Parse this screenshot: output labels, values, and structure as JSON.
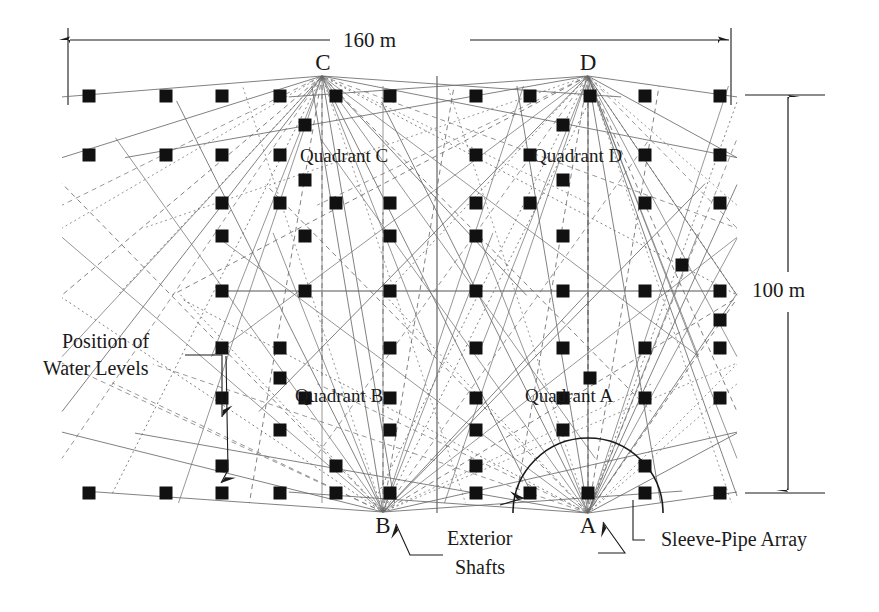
{
  "figure": {
    "type": "engineering-plan-diagram"
  },
  "dimensions": {
    "width_label": "160 m",
    "height_label": "100 m",
    "site_width_m": 160,
    "site_height_m": 100
  },
  "shafts": [
    {
      "id": "A",
      "label": "A",
      "x": 588,
      "y": 513,
      "has_arc": true
    },
    {
      "id": "B",
      "label": "B",
      "x": 383,
      "y": 512,
      "has_arc": false
    },
    {
      "id": "C",
      "label": "C",
      "x": 322,
      "y": 76,
      "has_arc": false
    },
    {
      "id": "D",
      "label": "D",
      "x": 588,
      "y": 76,
      "has_arc": false
    }
  ],
  "quadrants": [
    {
      "id": "A",
      "label": "Quadrant A",
      "x": 545,
      "y": 395
    },
    {
      "id": "B",
      "label": "Quadrant B",
      "x": 345,
      "y": 395
    },
    {
      "id": "C",
      "label": "Quadrant C",
      "x": 345,
      "y": 157
    },
    {
      "id": "D",
      "label": "Quadrant D",
      "x": 590,
      "y": 157
    }
  ],
  "callouts": [
    {
      "id": "water-levels",
      "line1": "Position of",
      "line2": "Water Levels",
      "x": 92,
      "y": 330
    },
    {
      "id": "exterior-shafts",
      "line1": "Exterior",
      "line2": "Shafts",
      "x": 447,
      "y": 527
    },
    {
      "id": "sleeve-pipe-array",
      "line1": "Sleeve-Pipe Array",
      "line2": "",
      "x": 653,
      "y": 530
    }
  ],
  "legend": {
    "marker_name": "water-level-monitoring-point",
    "marker_shape": "filled-square"
  },
  "colors": {
    "ink": "#1a1a1a",
    "marker": "#111111",
    "fan_line": "#6a6a6a",
    "grid_line": "#4a4a4a",
    "background": "#ffffff"
  },
  "chart_data": {
    "type": "scatter",
    "xlabel": "160 m",
    "ylabel": "100 m",
    "xlim": [
      0,
      160
    ],
    "ylim": [
      0,
      100
    ],
    "grid": false,
    "legend": "none",
    "annotations": [
      "Position of Water Levels",
      "Exterior Shafts",
      "Sleeve-Pipe Array",
      "Quadrant A",
      "Quadrant B",
      "Quadrant C",
      "Quadrant D"
    ],
    "series": [
      {
        "name": "Water-level monitoring points",
        "marker": "filled-square",
        "points": [
          [
            89,
            96
          ],
          [
            166,
            96
          ],
          [
            222,
            96
          ],
          [
            280,
            96
          ],
          [
            336,
            96
          ],
          [
            390,
            96
          ],
          [
            476,
            96
          ],
          [
            530,
            96
          ],
          [
            590,
            96
          ],
          [
            645,
            96
          ],
          [
            720,
            96
          ],
          [
            305,
            125
          ],
          [
            563,
            125
          ],
          [
            89,
            155
          ],
          [
            166,
            155
          ],
          [
            222,
            155
          ],
          [
            280,
            155
          ],
          [
            476,
            155
          ],
          [
            530,
            155
          ],
          [
            645,
            155
          ],
          [
            720,
            155
          ],
          [
            305,
            180
          ],
          [
            563,
            180
          ],
          [
            222,
            203
          ],
          [
            280,
            203
          ],
          [
            336,
            203
          ],
          [
            390,
            203
          ],
          [
            476,
            203
          ],
          [
            530,
            203
          ],
          [
            645,
            203
          ],
          [
            720,
            203
          ],
          [
            222,
            236
          ],
          [
            305,
            236
          ],
          [
            390,
            236
          ],
          [
            476,
            236
          ],
          [
            563,
            236
          ],
          [
            682,
            265
          ],
          [
            222,
            291
          ],
          [
            305,
            291
          ],
          [
            390,
            291
          ],
          [
            476,
            291
          ],
          [
            563,
            291
          ],
          [
            645,
            291
          ],
          [
            720,
            291
          ],
          [
            720,
            320
          ],
          [
            222,
            348
          ],
          [
            280,
            348
          ],
          [
            390,
            348
          ],
          [
            476,
            348
          ],
          [
            563,
            348
          ],
          [
            645,
            348
          ],
          [
            720,
            348
          ],
          [
            280,
            378
          ],
          [
            590,
            378
          ],
          [
            222,
            398
          ],
          [
            305,
            398
          ],
          [
            390,
            398
          ],
          [
            476,
            398
          ],
          [
            563,
            398
          ],
          [
            645,
            398
          ],
          [
            720,
            398
          ],
          [
            280,
            430
          ],
          [
            390,
            430
          ],
          [
            476,
            430
          ],
          [
            563,
            430
          ],
          [
            222,
            466
          ],
          [
            336,
            466
          ],
          [
            476,
            466
          ],
          [
            645,
            466
          ],
          [
            89,
            493
          ],
          [
            166,
            493
          ],
          [
            222,
            493
          ],
          [
            280,
            493
          ],
          [
            336,
            493
          ],
          [
            390,
            493
          ],
          [
            476,
            493
          ],
          [
            530,
            493
          ],
          [
            588,
            493
          ],
          [
            645,
            493
          ],
          [
            720,
            493
          ]
        ]
      }
    ]
  }
}
